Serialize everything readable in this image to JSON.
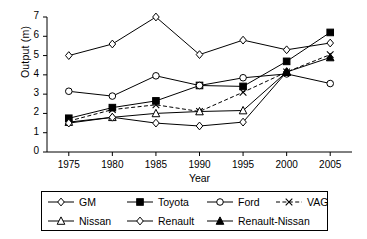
{
  "chart_data": {
    "type": "line",
    "title": "",
    "xlabel": "Year",
    "ylabel": "Output (m)",
    "categories": [
      1975,
      1980,
      1985,
      1990,
      1995,
      2000,
      2005
    ],
    "x_ticks": [
      "1975",
      "1980",
      "1985",
      "1990",
      "1995",
      "2000",
      "2005"
    ],
    "y_ticks": [
      "0",
      "1",
      "2",
      "3",
      "4",
      "5",
      "6",
      "7"
    ],
    "xlim": [
      1972.5,
      2007.5
    ],
    "ylim": [
      0,
      7
    ],
    "grid": false,
    "legend_position": "bottom",
    "series": [
      {
        "name": "GM",
        "marker": "open-diamond",
        "line": "solid",
        "values": [
          5.0,
          5.6,
          7.0,
          5.05,
          5.8,
          5.3,
          5.65
        ]
      },
      {
        "name": "Toyota",
        "marker": "filled-square",
        "line": "solid",
        "values": [
          1.75,
          2.3,
          2.65,
          3.45,
          3.4,
          4.7,
          6.2
        ]
      },
      {
        "name": "Ford",
        "marker": "open-circle",
        "line": "solid",
        "values": [
          3.15,
          2.9,
          3.95,
          3.45,
          3.85,
          4.05,
          3.55
        ]
      },
      {
        "name": "VAG",
        "marker": "cross-x",
        "line": "dashed",
        "values": [
          1.6,
          2.2,
          2.45,
          2.1,
          3.1,
          4.15,
          5.05
        ]
      },
      {
        "name": "Nissan",
        "marker": "open-triangle",
        "line": "solid",
        "values": [
          1.55,
          1.8,
          2.0,
          2.1,
          2.15,
          4.15,
          null
        ]
      },
      {
        "name": "Renault",
        "marker": "open-diamond",
        "line": "solid",
        "values": [
          1.5,
          1.8,
          1.5,
          1.35,
          1.55,
          4.15,
          null
        ]
      },
      {
        "name": "Renault-Nissan",
        "marker": "filled-triangle",
        "line": "solid",
        "values": [
          null,
          null,
          null,
          null,
          null,
          4.15,
          4.9
        ]
      }
    ]
  },
  "legend": {
    "entries": [
      {
        "label": "GM"
      },
      {
        "label": "Toyota"
      },
      {
        "label": "Ford"
      },
      {
        "label": "VAG"
      },
      {
        "label": "Nissan"
      },
      {
        "label": "Renault"
      },
      {
        "label": "Renault-Nissan"
      }
    ]
  },
  "colors": {
    "ink": "#000000",
    "background": "#ffffff"
  }
}
